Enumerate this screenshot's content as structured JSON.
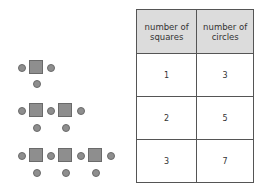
{
  "table": {
    "headers": [
      "number of squares",
      "number of circles"
    ],
    "rows": [
      [
        "1",
        "3"
      ],
      [
        "2",
        "5"
      ],
      [
        "3",
        "7"
      ]
    ]
  },
  "figures": [
    {
      "squares": 1,
      "circles": 3
    },
    {
      "squares": 2,
      "circles": 5
    },
    {
      "squares": 3,
      "circles": 7
    }
  ],
  "colors": {
    "shape_fill": "#8e8e8e",
    "header_bg": "#dcdcdc",
    "border": "#555555"
  }
}
